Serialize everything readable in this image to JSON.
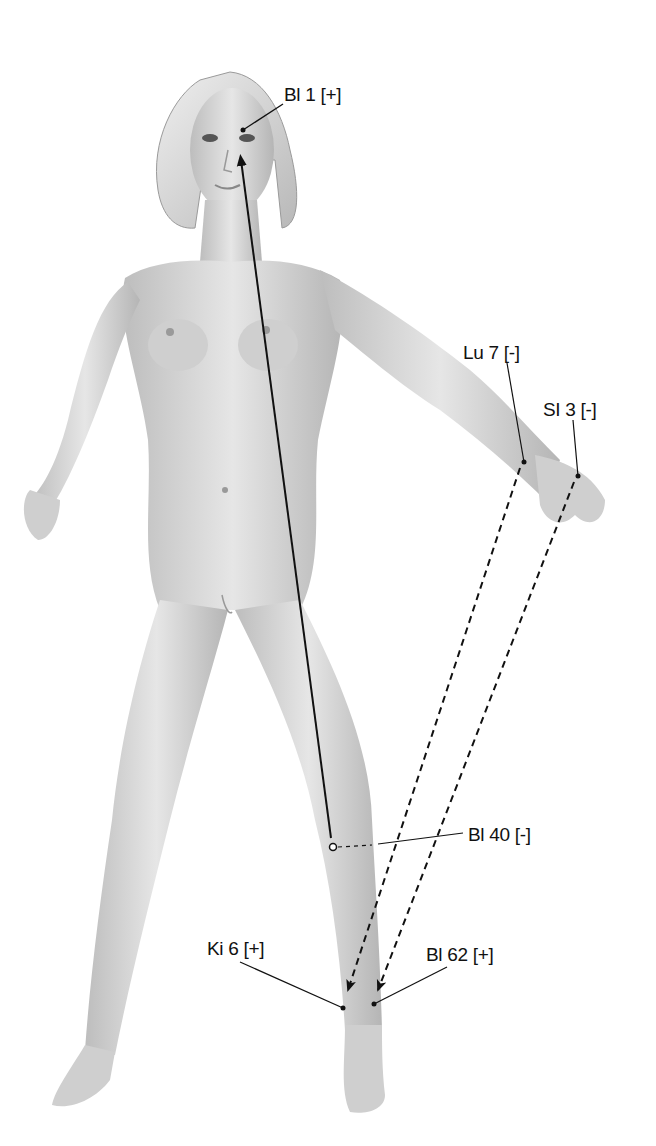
{
  "diagram": {
    "colors": {
      "skin": "#d9d9d9",
      "skin_shadow": "#a8a8a8",
      "line": "#111111",
      "background": "#ffffff"
    },
    "points": [
      {
        "id": "bl1",
        "label": "Bl 1 [+]",
        "x": 243,
        "y": 130
      },
      {
        "id": "lu7",
        "label": "Lu 7 [-]",
        "x": 524,
        "y": 462
      },
      {
        "id": "si3",
        "label": "SI 3 [-]",
        "x": 578,
        "y": 476
      },
      {
        "id": "bl40",
        "label": "Bl 40 [-]",
        "x": 333,
        "y": 847
      },
      {
        "id": "ki6",
        "label": "Ki 6 [+]",
        "x": 343,
        "y": 1008
      },
      {
        "id": "bl62",
        "label": "Bl 62 [+]",
        "x": 374,
        "y": 1004
      }
    ],
    "connections": [
      {
        "from": "Bl 40 [-]",
        "to": "Bl 1 [+]",
        "style": "solid-arrow"
      },
      {
        "from": "Lu 7 [-]",
        "to": "Ki 6 [+]",
        "style": "dashed-arrow"
      },
      {
        "from": "SI 3 [-]",
        "to": "Bl 62 [+]",
        "style": "dashed-arrow"
      }
    ]
  }
}
